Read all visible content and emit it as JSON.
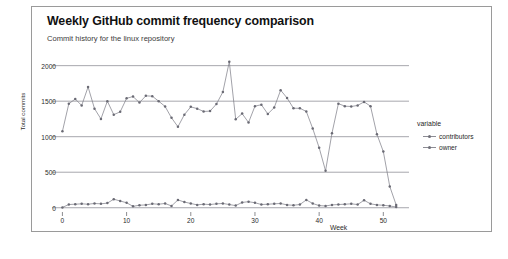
{
  "chart_data": {
    "type": "line",
    "title": "Weekly GitHub commit frequency comparison",
    "subtitle": "Commit history for the linux repository",
    "xlabel": "Week",
    "ylabel": "Total commits",
    "xlim": [
      -1,
      54
    ],
    "ylim": [
      -60,
      2150
    ],
    "xticks": [
      0,
      10,
      20,
      30,
      40,
      50
    ],
    "yticks": [
      0,
      500,
      1000,
      1500,
      2000
    ],
    "grid": "horizontal",
    "legend_title": "variable",
    "legend_position": "right",
    "marker": "point",
    "series_color": "#7a7a84",
    "series": [
      {
        "name": "contributors",
        "x": [
          0,
          1,
          2,
          3,
          4,
          5,
          6,
          7,
          8,
          9,
          10,
          11,
          12,
          13,
          14,
          15,
          16,
          17,
          18,
          19,
          20,
          21,
          22,
          23,
          24,
          25,
          26,
          27,
          28,
          29,
          30,
          31,
          32,
          33,
          34,
          35,
          36,
          37,
          38,
          39,
          40,
          41,
          42,
          43,
          44,
          45,
          46,
          47,
          48,
          49,
          50,
          51,
          52
        ],
        "values": [
          1075,
          1465,
          1530,
          1440,
          1700,
          1395,
          1250,
          1500,
          1310,
          1350,
          1540,
          1565,
          1480,
          1575,
          1570,
          1500,
          1425,
          1265,
          1140,
          1310,
          1420,
          1395,
          1355,
          1360,
          1460,
          1630,
          2055,
          1245,
          1325,
          1200,
          1430,
          1450,
          1320,
          1410,
          1655,
          1545,
          1400,
          1400,
          1355,
          1115,
          845,
          520,
          1050,
          1465,
          1430,
          1425,
          1440,
          1490,
          1430,
          1035,
          790,
          300,
          40
        ]
      },
      {
        "name": "owner",
        "x": [
          0,
          1,
          2,
          3,
          4,
          5,
          6,
          7,
          8,
          9,
          10,
          11,
          12,
          13,
          14,
          15,
          16,
          17,
          18,
          19,
          20,
          21,
          22,
          23,
          24,
          25,
          26,
          27,
          28,
          29,
          30,
          31,
          32,
          33,
          34,
          35,
          36,
          37,
          38,
          39,
          40,
          41,
          42,
          43,
          44,
          45,
          46,
          47,
          48,
          49,
          50,
          51,
          52
        ],
        "values": [
          5,
          45,
          50,
          55,
          50,
          60,
          55,
          65,
          120,
          95,
          70,
          20,
          35,
          40,
          55,
          50,
          60,
          25,
          110,
          80,
          60,
          40,
          50,
          45,
          55,
          60,
          45,
          30,
          75,
          85,
          70,
          45,
          50,
          55,
          60,
          40,
          35,
          45,
          110,
          60,
          30,
          25,
          40,
          45,
          50,
          55,
          45,
          105,
          55,
          40,
          35,
          25,
          10
        ]
      }
    ]
  }
}
